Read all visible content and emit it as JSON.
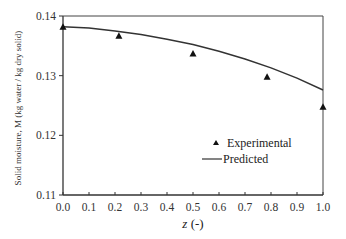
{
  "chart_data": {
    "type": "scatter",
    "title": "",
    "xlabel": "z (-)",
    "xlabel_italic_part": "z",
    "xlabel_rest": " (-)",
    "ylabel": "Solid moisture, M (kg water / kg dry solid)",
    "xlim": [
      0.0,
      1.0
    ],
    "ylim": [
      0.11,
      0.14
    ],
    "x_ticks": [
      "0.0",
      "0.1",
      "0.2",
      "0.3",
      "0.4",
      "0.5",
      "0.6",
      "0.7",
      "0.8",
      "0.9",
      "1.0"
    ],
    "y_ticks": [
      "0.11",
      "0.12",
      "0.13",
      "0.14"
    ],
    "grid": false,
    "legend_position": "lower-center-right inside plot",
    "series": [
      {
        "name": "Experimental",
        "type": "scatter",
        "marker": "triangle",
        "color": "#111111",
        "x": [
          0.0,
          0.215,
          0.5,
          0.785,
          1.0
        ],
        "y": [
          0.1382,
          0.1367,
          0.1337,
          0.1298,
          0.1248
        ]
      },
      {
        "name": "Predicted",
        "type": "line",
        "color": "#333333",
        "x": [
          0.0,
          0.1,
          0.2,
          0.3,
          0.4,
          0.5,
          0.6,
          0.7,
          0.8,
          0.9,
          1.0
        ],
        "y": [
          0.1382,
          0.138,
          0.1375,
          0.1369,
          0.1361,
          0.1352,
          0.1341,
          0.1328,
          0.1313,
          0.1296,
          0.1276
        ]
      }
    ]
  },
  "legend": {
    "items": [
      {
        "label": "Experimental",
        "symbol": "triangle"
      },
      {
        "label": "Predicted",
        "symbol": "line"
      }
    ]
  }
}
